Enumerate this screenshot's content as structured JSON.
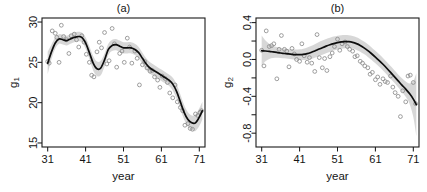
{
  "figure": {
    "width": 427,
    "height": 192,
    "background": "#ffffff",
    "panel_count": 2
  },
  "style": {
    "line_color": "#0d0d0d",
    "band_color": "#d4d4d4",
    "point_color": "#8c8c8c",
    "axis_color": "#1a1a1a",
    "text_color": "#141414"
  },
  "chart_data": [
    {
      "id": "panel-a",
      "type": "scatter",
      "title": "(a)",
      "xlabel": "year",
      "ylabel": "g1",
      "ylabel_display": "g₁",
      "xlim": [
        29.5,
        72.5
      ],
      "ylim": [
        14.5,
        30.5
      ],
      "xticks": [
        31,
        41,
        51,
        61,
        71
      ],
      "xticklabels": [
        "31",
        "41",
        "51",
        "61",
        "71"
      ],
      "yticks": [
        15,
        20,
        25,
        30
      ],
      "yticklabels": [
        "15",
        "20",
        "25",
        "30"
      ],
      "grid": false,
      "legend": null,
      "series": [
        {
          "name": "observations",
          "marker": "open-circle",
          "x": [
            31.0,
            31.4,
            32.2,
            33.0,
            33.4,
            34.0,
            34.6,
            35.2,
            36.0,
            36.6,
            37.2,
            38.0,
            38.6,
            39.2,
            40.0,
            40.6,
            41.2,
            42.0,
            42.6,
            43.2,
            44.0,
            44.6,
            45.2,
            46.0,
            46.6,
            47.2,
            48.0,
            48.6,
            49.2,
            50.0,
            50.6,
            51.2,
            52.0,
            52.6,
            53.2,
            54.0,
            54.6,
            55.2,
            56.0,
            56.6,
            57.2,
            58.0,
            58.6,
            59.2,
            60.0,
            60.6,
            61.2,
            62.0,
            62.6,
            63.2,
            64.0,
            64.6,
            65.2,
            66.0,
            66.6,
            67.2,
            68.0,
            68.6,
            69.2,
            70.0,
            70.6,
            71.2,
            71.6
          ],
          "y": [
            25.1,
            24.9,
            28.9,
            28.6,
            28.1,
            25.0,
            29.6,
            28.2,
            27.8,
            26.1,
            28.3,
            28.5,
            27.8,
            26.9,
            28.3,
            27.5,
            26.0,
            25.0,
            23.4,
            23.2,
            26.3,
            27.5,
            26.8,
            28.7,
            24.8,
            25.2,
            29.2,
            27.3,
            24.4,
            26.1,
            26.4,
            25.0,
            28.0,
            26.9,
            24.9,
            26.4,
            25.5,
            22.2,
            24.7,
            25.1,
            24.3,
            23.9,
            24.0,
            23.2,
            22.8,
            21.9,
            23.3,
            23.0,
            22.5,
            21.2,
            20.6,
            22.2,
            20.1,
            19.4,
            19.0,
            17.2,
            17.4,
            16.8,
            16.7,
            18.6,
            18.4,
            18.8,
            19.0
          ]
        },
        {
          "name": "smooth-fit",
          "marker": "line",
          "x": [
            31,
            32,
            33,
            34,
            35,
            36,
            37,
            38,
            39,
            40,
            41,
            42,
            43,
            44,
            45,
            46,
            47,
            48,
            49,
            50,
            51,
            52,
            53,
            54,
            55,
            56,
            57,
            58,
            59,
            60,
            61,
            62,
            63,
            64,
            65,
            66,
            67,
            68,
            69,
            70,
            71,
            71.8
          ],
          "y": [
            24.9,
            26.3,
            27.4,
            27.9,
            27.8,
            27.7,
            27.9,
            28.1,
            28.2,
            28.1,
            27.4,
            26.2,
            24.9,
            24.2,
            24.3,
            25.3,
            26.6,
            27.1,
            27.2,
            27.0,
            26.8,
            26.8,
            26.8,
            26.6,
            26.2,
            25.5,
            24.8,
            24.3,
            24.0,
            23.7,
            23.4,
            23.1,
            22.8,
            22.3,
            21.4,
            20.1,
            18.8,
            17.9,
            17.5,
            17.5,
            18.2,
            19.0
          ]
        }
      ],
      "confidence_band": {
        "x": [
          31,
          32,
          33,
          34,
          35,
          36,
          37,
          38,
          39,
          40,
          41,
          42,
          43,
          44,
          45,
          46,
          47,
          48,
          49,
          50,
          51,
          52,
          53,
          54,
          55,
          56,
          57,
          58,
          59,
          60,
          61,
          62,
          63,
          64,
          65,
          66,
          67,
          68,
          69,
          70,
          71,
          71.8
        ],
        "upper": [
          26.3,
          27.2,
          28.1,
          28.5,
          28.4,
          28.3,
          28.5,
          28.7,
          28.8,
          28.7,
          28.1,
          27.0,
          25.8,
          25.1,
          25.2,
          26.1,
          27.3,
          27.8,
          27.9,
          27.7,
          27.5,
          27.5,
          27.5,
          27.3,
          26.9,
          26.2,
          25.5,
          25.0,
          24.7,
          24.4,
          24.1,
          23.8,
          23.5,
          23.1,
          22.3,
          21.0,
          19.7,
          18.8,
          18.4,
          18.5,
          19.3,
          20.1
        ],
        "lower": [
          23.5,
          25.4,
          26.7,
          27.3,
          27.2,
          27.1,
          27.3,
          27.5,
          27.6,
          27.5,
          26.7,
          25.4,
          24.0,
          23.3,
          23.4,
          24.5,
          25.9,
          26.4,
          26.5,
          26.3,
          26.1,
          26.1,
          26.1,
          25.9,
          25.5,
          24.8,
          24.1,
          23.6,
          23.3,
          23.0,
          22.7,
          22.4,
          22.1,
          21.5,
          20.5,
          19.2,
          17.9,
          17.0,
          16.6,
          16.5,
          17.1,
          17.9
        ]
      }
    },
    {
      "id": "panel-b",
      "type": "scatter",
      "title": "(b)",
      "xlabel": "year",
      "ylabel": "g2",
      "ylabel_display": "g₂",
      "xlim": [
        29.5,
        72.5
      ],
      "ylim": [
        -0.95,
        0.45
      ],
      "xticks": [
        31,
        41,
        51,
        61,
        71
      ],
      "xticklabels": [
        "31",
        "41",
        "51",
        "61",
        "71"
      ],
      "yticks": [
        -0.8,
        -0.6,
        -0.4,
        -0.2,
        0.0,
        0.2,
        0.4
      ],
      "yticklabels": [
        "-0.8",
        "",
        "-0.4",
        "",
        "0.0",
        "",
        "0.4"
      ],
      "grid": false,
      "legend": null,
      "series": [
        {
          "name": "observations",
          "marker": "open-circle",
          "x": [
            31.0,
            31.6,
            32.2,
            33.0,
            33.6,
            34.2,
            35.0,
            35.6,
            36.2,
            37.0,
            37.6,
            38.2,
            39.0,
            39.6,
            40.2,
            41.0,
            41.6,
            42.2,
            43.0,
            43.6,
            44.2,
            45.0,
            45.6,
            46.2,
            47.0,
            47.6,
            48.2,
            49.0,
            49.6,
            50.2,
            51.0,
            51.6,
            52.2,
            53.0,
            53.6,
            54.2,
            55.0,
            55.6,
            56.2,
            57.0,
            57.6,
            58.2,
            59.0,
            59.6,
            60.2,
            61.0,
            61.6,
            62.2,
            63.0,
            63.6,
            64.2,
            65.0,
            65.6,
            66.2,
            67.0,
            67.6,
            68.2,
            69.0,
            69.6,
            70.2,
            71.0,
            71.6
          ],
          "y": [
            0.1,
            -0.07,
            0.31,
            0.14,
            0.15,
            0.17,
            -0.21,
            0.11,
            0.26,
            0.11,
            0.09,
            -0.08,
            0.12,
            0.06,
            0.0,
            -0.02,
            0.17,
            0.04,
            -0.03,
            0.02,
            -0.04,
            -0.13,
            0.27,
            0.02,
            -0.09,
            0.01,
            -0.12,
            0.03,
            0.07,
            0.14,
            0.22,
            0.1,
            0.17,
            0.19,
            0.14,
            0.11,
            0.09,
            0.03,
            0.04,
            -0.02,
            -0.04,
            -0.07,
            -0.09,
            -0.16,
            -0.14,
            -0.22,
            -0.19,
            -0.27,
            -0.21,
            -0.24,
            -0.25,
            -0.18,
            -0.3,
            -0.36,
            -0.4,
            -0.62,
            -0.34,
            -0.46,
            -0.18,
            -0.17,
            -0.25,
            -0.48
          ]
        },
        {
          "name": "smooth-fit",
          "marker": "line",
          "x": [
            31,
            32,
            33,
            34,
            35,
            36,
            37,
            38,
            39,
            40,
            41,
            42,
            43,
            44,
            45,
            46,
            47,
            48,
            49,
            50,
            51,
            52,
            53,
            54,
            55,
            56,
            57,
            58,
            59,
            60,
            61,
            62,
            63,
            64,
            65,
            66,
            67,
            68,
            69,
            70,
            71,
            71.8
          ],
          "y": [
            0.095,
            0.092,
            0.088,
            0.082,
            0.076,
            0.07,
            0.065,
            0.06,
            0.056,
            0.053,
            0.052,
            0.055,
            0.063,
            0.076,
            0.092,
            0.11,
            0.128,
            0.145,
            0.16,
            0.172,
            0.182,
            0.19,
            0.194,
            0.193,
            0.186,
            0.172,
            0.152,
            0.126,
            0.096,
            0.062,
            0.026,
            -0.012,
            -0.052,
            -0.095,
            -0.14,
            -0.186,
            -0.232,
            -0.278,
            -0.322,
            -0.37,
            -0.43,
            -0.49
          ]
        }
      ],
      "confidence_band": {
        "x": [
          31,
          32,
          33,
          34,
          35,
          36,
          37,
          38,
          39,
          40,
          41,
          42,
          43,
          44,
          45,
          46,
          47,
          48,
          49,
          50,
          51,
          52,
          53,
          54,
          55,
          56,
          57,
          58,
          59,
          60,
          61,
          62,
          63,
          64,
          65,
          66,
          67,
          68,
          69,
          70,
          71,
          71.8
        ],
        "upper": [
          0.26,
          0.205,
          0.17,
          0.148,
          0.134,
          0.124,
          0.118,
          0.113,
          0.11,
          0.108,
          0.11,
          0.117,
          0.13,
          0.147,
          0.166,
          0.186,
          0.205,
          0.222,
          0.236,
          0.248,
          0.257,
          0.263,
          0.265,
          0.262,
          0.254,
          0.24,
          0.22,
          0.194,
          0.164,
          0.13,
          0.094,
          0.056,
          0.016,
          -0.027,
          -0.072,
          -0.118,
          -0.163,
          -0.205,
          -0.238,
          -0.26,
          -0.235,
          -0.15
        ],
        "lower": [
          -0.07,
          -0.02,
          0.006,
          0.016,
          0.018,
          0.016,
          0.012,
          0.007,
          0.002,
          -0.002,
          -0.006,
          -0.007,
          -0.004,
          0.005,
          0.018,
          0.034,
          0.051,
          0.068,
          0.084,
          0.096,
          0.107,
          0.117,
          0.123,
          0.124,
          0.118,
          0.104,
          0.084,
          0.058,
          0.028,
          -0.006,
          -0.042,
          -0.08,
          -0.12,
          -0.163,
          -0.208,
          -0.254,
          -0.301,
          -0.351,
          -0.406,
          -0.48,
          -0.625,
          -0.83
        ]
      }
    }
  ]
}
